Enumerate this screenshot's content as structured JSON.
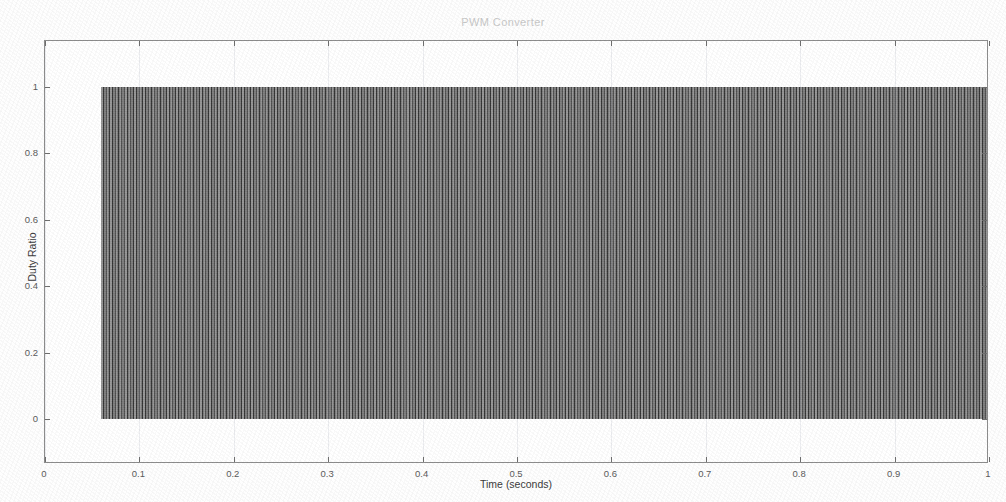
{
  "chart_data": {
    "type": "area",
    "title": "PWM Converter",
    "xlabel": "Time (seconds)",
    "ylabel": "Duty Ratio",
    "xlim": [
      0,
      1
    ],
    "ylim": [
      0,
      1
    ],
    "grid": false,
    "legend": null,
    "xticks": [
      "0",
      "0.1",
      "0.2",
      "0.3",
      "0.4",
      "0.5",
      "0.6",
      "0.7",
      "0.8",
      "0.9",
      "1"
    ],
    "xtick_values": [
      0,
      0.1,
      0.2,
      0.3,
      0.4,
      0.5,
      0.6,
      0.7,
      0.8,
      0.9,
      1
    ],
    "yticks": [
      "0",
      "0.2",
      "0.4",
      "0.6",
      "0.8",
      "1"
    ],
    "ytick_values": [
      0,
      0.2,
      0.4,
      0.6,
      0.8,
      1
    ],
    "series": [
      {
        "name": "PWM duty ratio",
        "description": "High-frequency PWM switching waveform; samples alternate between 0 and 1 so densely that the trace renders as a solid filled band",
        "color": "#4e4e4e",
        "x_start": 0.059,
        "x_end": 1.0,
        "y_low": 0,
        "y_high": 1,
        "pre_signal_x_start": 0,
        "pre_signal_x_end": 0.059,
        "pre_signal_value": 0
      }
    ]
  },
  "figure": {
    "background_color": "#ffffff",
    "axes_border_color": "#8d8d8d",
    "tick_color": "#6f6f6f",
    "title_color": "#c9c9c9",
    "label_color": "#3c3c3c"
  }
}
